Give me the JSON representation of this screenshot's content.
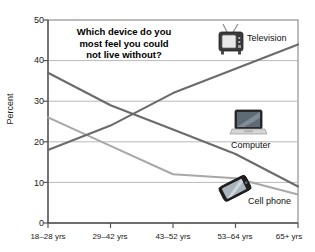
{
  "chart_data": {
    "type": "line",
    "title": "Which device do you most feel you could not live without?",
    "title_lines": [
      "Which device do you",
      "most feel you could",
      "not live without?"
    ],
    "xlabel": "",
    "ylabel": "Percent",
    "ylim": [
      0,
      50
    ],
    "yticks": [
      0,
      10,
      20,
      30,
      40,
      50
    ],
    "ytick_labels": [
      "0",
      "10",
      "20",
      "30",
      "40",
      "50"
    ],
    "categories": [
      "18–28 yrs",
      "29–42 yrs",
      "43–52 yrs",
      "53–64 yrs",
      "65+ yrs"
    ],
    "grid": true,
    "grid_axis": "y",
    "legend_position": "inline-right",
    "series": [
      {
        "name": "Television",
        "color": "#6b6b6b",
        "values": [
          18,
          24,
          32,
          38,
          44
        ]
      },
      {
        "name": "Computer",
        "color": "#6b6b6b",
        "values": [
          37,
          29,
          23,
          17,
          9
        ]
      },
      {
        "name": "Cell phone",
        "color": "#a8a8a8",
        "values": [
          26,
          19,
          12,
          11,
          7
        ]
      }
    ]
  },
  "labels": {
    "television": "Television",
    "computer": "Computer",
    "cell_phone": "Cell phone"
  },
  "icons": {
    "television": "television-icon",
    "computer": "laptop-computer-icon",
    "cell_phone": "cell-phone-icon"
  },
  "colors": {
    "line_dark": "#6b6b6b",
    "line_light": "#a8a8a8",
    "grid": "#b9b9b9",
    "axis": "#555555",
    "text": "#1a1a1a",
    "background": "#ffffff"
  },
  "yticks": {
    "t0": "0",
    "t10": "10",
    "t20": "20",
    "t30": "30",
    "t40": "40",
    "t50": "50"
  },
  "xticks": {
    "c0": "18–28 yrs",
    "c1": "29–42 yrs",
    "c2": "43–52 yrs",
    "c3": "53–64 yrs",
    "c4": "65+ yrs"
  },
  "title": {
    "l1": "Which device do you",
    "l2": "most feel you could",
    "l3": "not live without?"
  }
}
